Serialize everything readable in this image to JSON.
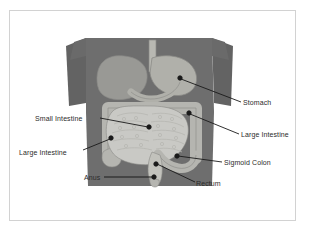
{
  "document": {
    "type": "anatomy-diagram",
    "title": "Digestive System Diagram",
    "background_color": "#ffffff",
    "frame_border_color": "#d2d2d2"
  },
  "illustration": {
    "name": "human-torso-digestive-system",
    "description": "Grey silhouette of a human torso in a long-sleeved shirt with the digestive organs shown inside the abdomen",
    "colors": {
      "torso": "#6e6e6e",
      "torso_shadow": "#636363",
      "liver": "#999995",
      "stomach": "#b0b0aa",
      "esophagus": "#b8b8b2",
      "small_intestine": "#c9c9c5",
      "large_intestine": "#b5b5b0",
      "rectum": "#c2c2bc",
      "outline": "#8a8a86"
    },
    "organs": [
      {
        "name": "esophagus"
      },
      {
        "name": "liver"
      },
      {
        "name": "stomach"
      },
      {
        "name": "duodenum"
      },
      {
        "name": "large-intestine"
      },
      {
        "name": "small-intestine"
      },
      {
        "name": "sigmoid-colon"
      },
      {
        "name": "rectum"
      },
      {
        "name": "anus"
      }
    ]
  },
  "labels": [
    {
      "id": "stomach",
      "text": "Stomach",
      "side": "right"
    },
    {
      "id": "large-right",
      "text": "Large Intestine",
      "side": "right"
    },
    {
      "id": "small-left",
      "text": "Small Intestine",
      "side": "left"
    },
    {
      "id": "large-left",
      "text": "Large Intestine",
      "side": "left"
    },
    {
      "id": "sigmoid",
      "text": "Sigmoid Colon",
      "side": "right"
    },
    {
      "id": "anus",
      "text": "Anus",
      "side": "left"
    },
    {
      "id": "rectum",
      "text": "Rectum",
      "side": "right"
    }
  ],
  "leader_lines": {
    "color": "#1a1a1a",
    "marker": "dot"
  }
}
